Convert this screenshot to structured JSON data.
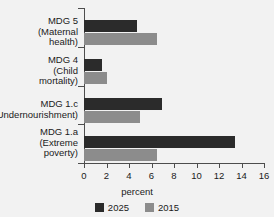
{
  "chart_data": {
    "type": "bar",
    "orientation": "horizontal",
    "title": "",
    "xlabel": "percent",
    "ylabel": "",
    "xlim": [
      0,
      16
    ],
    "xticks": [
      0,
      2,
      4,
      6,
      8,
      10,
      12,
      14,
      16
    ],
    "xtick_labels": [
      "0",
      "2",
      "4",
      "6",
      "8",
      "10",
      "12",
      "14",
      "16"
    ],
    "grid": false,
    "legend_position": "bottom",
    "categories": [
      "MDG 5\n(Maternal\nhealth)",
      "MDG 4\n(Child\nmortality)",
      "MDG 1.c\n(Undernourishment)",
      "MDG 1.a\n(Extreme\npoverty)"
    ],
    "category_lines": [
      [
        "MDG 5",
        "(Maternal",
        "health)"
      ],
      [
        "MDG 4",
        "(Child",
        "mortality)"
      ],
      [
        "MDG 1.c",
        "(Undernourishment)"
      ],
      [
        "MDG 1.a",
        "(Extreme",
        "poverty)"
      ]
    ],
    "series": [
      {
        "name": "2025",
        "color": "#2b2b2b",
        "values": [
          4.7,
          1.6,
          6.9,
          13.4
        ]
      },
      {
        "name": "2015",
        "color": "#8c8c8c",
        "values": [
          6.5,
          2.0,
          5.0,
          6.5
        ]
      }
    ]
  },
  "legend": {
    "items": [
      {
        "label": "2025",
        "color": "#2b2b2b"
      },
      {
        "label": "2015",
        "color": "#8c8c8c"
      }
    ]
  },
  "axis": {
    "x_title": "percent"
  }
}
